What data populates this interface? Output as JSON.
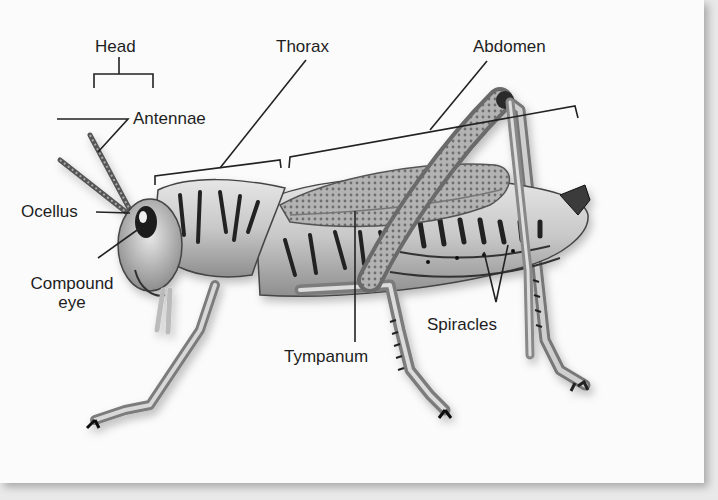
{
  "diagram": {
    "colors": {
      "background": "#fbfbfb",
      "ink": "#1e1e1e",
      "shadow": "#cfcfcf"
    },
    "labels": {
      "head": "Head",
      "thorax": "Thorax",
      "abdomen": "Abdomen",
      "antennae": "Antennae",
      "ocellus": "Ocellus",
      "compound_eye_line1": "Compound",
      "compound_eye_line2": "eye",
      "tympanum": "Tympanum",
      "spiracles": "Spiracles"
    }
  }
}
